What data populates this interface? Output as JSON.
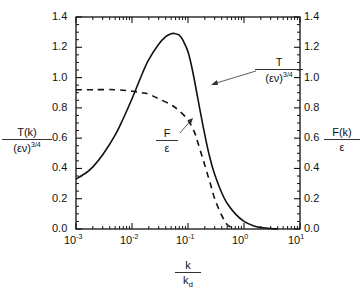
{
  "chart_data": {
    "type": "line",
    "title": "",
    "xlabel": "k / k_d",
    "xlabel_num": "k",
    "xlabel_den_main": "k",
    "xlabel_den_sub": "d",
    "ylabel_left": "T(k) / (εν)^3/4",
    "ylabel_left_num": "T(k)",
    "ylabel_left_den": "(εν)",
    "ylabel_left_den_sup": "3/4",
    "ylabel_right": "F(k) / ε",
    "ylabel_right_num": "F(k)",
    "ylabel_right_den": "ε",
    "xscale": "log",
    "xlim": [
      0.001,
      10
    ],
    "ylim": [
      0.0,
      1.4
    ],
    "y2lim": [
      0.0,
      1.4
    ],
    "x_tick_labels": [
      {
        "base": "10",
        "exp": "-3"
      },
      {
        "base": "10",
        "exp": "-2"
      },
      {
        "base": "10",
        "exp": "-1"
      },
      {
        "base": "10",
        "exp": "0"
      },
      {
        "base": "10",
        "exp": "1"
      }
    ],
    "y_tick_labels": [
      "0.0",
      "0.2",
      "0.4",
      "0.6",
      "0.8",
      "1.0",
      "1.2",
      "1.4"
    ],
    "grid": false,
    "series": [
      {
        "name": "T/(εν)^3/4",
        "style": "solid",
        "axis": "left",
        "x": [
          0.001,
          0.0015,
          0.002,
          0.003,
          0.005,
          0.007,
          0.01,
          0.015,
          0.02,
          0.03,
          0.04,
          0.05,
          0.06,
          0.07,
          0.08,
          0.1,
          0.12,
          0.15,
          0.2,
          0.25,
          0.3,
          0.4,
          0.5,
          0.7,
          1.0,
          1.5,
          2.0,
          3.0,
          4.0
        ],
        "values": [
          0.33,
          0.37,
          0.41,
          0.49,
          0.62,
          0.73,
          0.86,
          1.02,
          1.12,
          1.22,
          1.27,
          1.29,
          1.29,
          1.28,
          1.25,
          1.17,
          1.05,
          0.86,
          0.62,
          0.46,
          0.36,
          0.24,
          0.17,
          0.1,
          0.05,
          0.02,
          0.01,
          0.003,
          0.0
        ]
      },
      {
        "name": "F/ε",
        "style": "dashed",
        "axis": "right",
        "x": [
          0.001,
          0.002,
          0.005,
          0.01,
          0.015,
          0.02,
          0.03,
          0.05,
          0.07,
          0.1,
          0.13,
          0.15,
          0.2,
          0.25,
          0.3,
          0.4,
          0.5,
          0.6,
          0.7
        ],
        "values": [
          0.92,
          0.92,
          0.92,
          0.91,
          0.9,
          0.89,
          0.86,
          0.82,
          0.78,
          0.72,
          0.64,
          0.57,
          0.42,
          0.3,
          0.2,
          0.09,
          0.03,
          0.01,
          0.0
        ]
      }
    ],
    "annotations": [
      {
        "text_num": "T",
        "text_den": "(εν)",
        "text_den_sup": "3/4",
        "points_to": "solid curve"
      },
      {
        "text_num": "F",
        "text_den": "ε",
        "points_to": "dashed curve"
      }
    ]
  }
}
